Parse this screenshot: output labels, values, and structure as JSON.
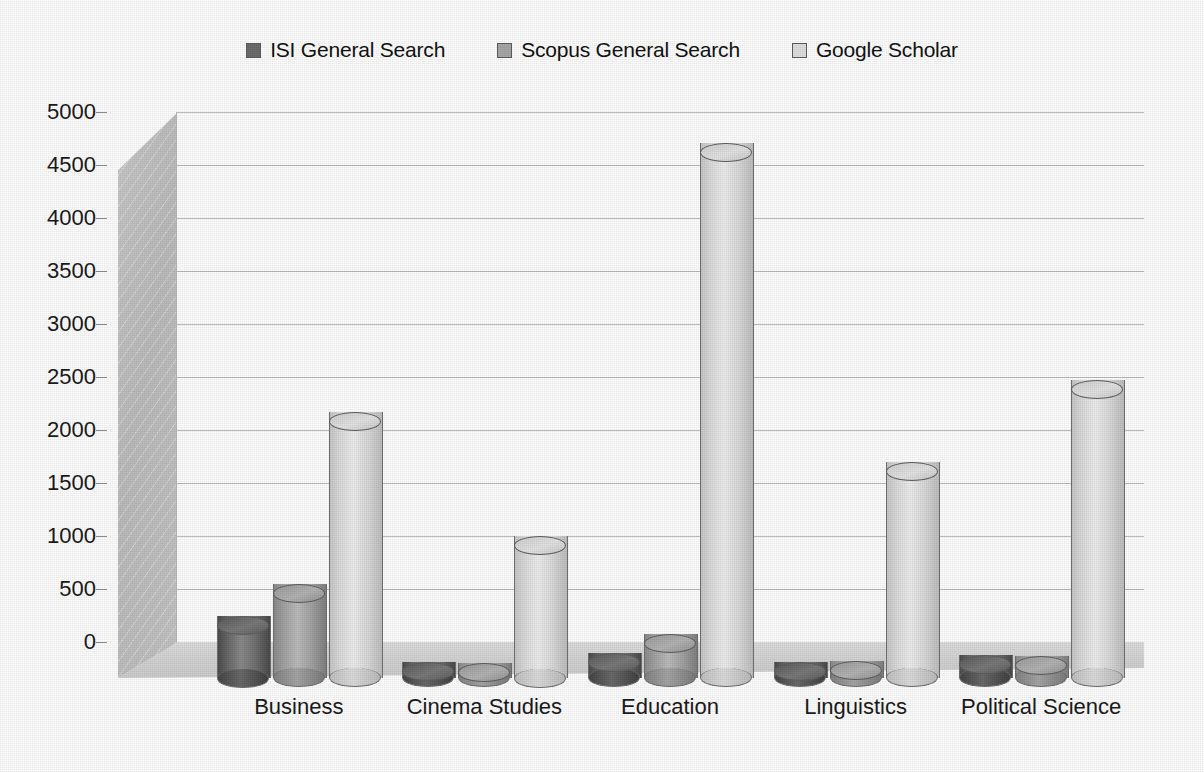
{
  "chart_data": {
    "type": "bar",
    "title": "",
    "subtitle": "",
    "xlabel": "",
    "ylabel": "",
    "categories": [
      "Business",
      "Cinema Studies",
      "Education",
      "Linguistics",
      "Political Science"
    ],
    "series": [
      {
        "name": "ISI General Search",
        "color": "#6d6d6d",
        "values": [
          500,
          60,
          150,
          60,
          130
        ]
      },
      {
        "name": "Scopus General Search",
        "color": "#a8a8a8",
        "values": [
          800,
          50,
          330,
          70,
          120
        ]
      },
      {
        "name": "Google Scholar",
        "color": "#e0e0e0",
        "values": [
          2420,
          1250,
          4960,
          1950,
          2720
        ]
      }
    ],
    "ylim": [
      0,
      5000
    ],
    "yticks": [
      0,
      500,
      1000,
      1500,
      2000,
      2500,
      3000,
      3500,
      4000,
      4500,
      5000
    ],
    "ytick_labels": [
      "0",
      "500",
      "1000",
      "1500",
      "2000",
      "2500",
      "3000",
      "3500",
      "4000",
      "4500",
      "5000"
    ],
    "grid": true,
    "grid_axis": "y",
    "legend_position": "top",
    "style": "3d-clustered-cylinder"
  },
  "legend": {
    "items": [
      {
        "label": "ISI General Search",
        "swatch": "#6d6d6d"
      },
      {
        "label": "Scopus General Search",
        "swatch": "#a8a8a8"
      },
      {
        "label": "Google Scholar",
        "swatch": "#e0e0e0"
      }
    ]
  }
}
